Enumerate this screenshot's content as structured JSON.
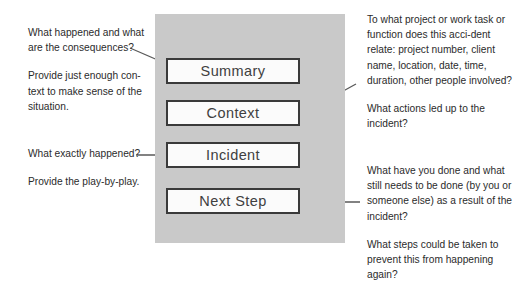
{
  "diagram": {
    "panel_color": "#c9c9c9",
    "box_border_color": "#3a3a3a",
    "box_fill_color": "#fbfbfb",
    "arrow_color": "#595959",
    "stages": [
      {
        "label": "Summary"
      },
      {
        "label": "Context"
      },
      {
        "label": "Incident"
      },
      {
        "label": "Next Step"
      }
    ],
    "notes": {
      "left_top": {
        "paragraph_1": "What happened and what are the consequences?",
        "paragraph_2": "Provide just enough con-text to make sense of the situation."
      },
      "left_bottom": {
        "paragraph_1": "What exactly happened?",
        "paragraph_2": "Provide the play-by-play."
      },
      "right_top": {
        "paragraph_1": "To what project or work task or function does this acci-dent relate: project number, client name, location, date, time, duration, other people involved?",
        "paragraph_2": "What actions led up to the incident?"
      },
      "right_bottom": {
        "paragraph_1": "What have you done and what still needs to be done (by you or someone else) as a result of the incident?",
        "paragraph_2": "What steps could be taken to prevent this from happening again?"
      }
    }
  }
}
